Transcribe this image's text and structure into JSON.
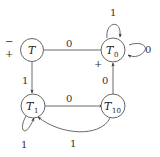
{
  "diagram": {
    "type": "finite-automaton",
    "states": [
      {
        "id": "T",
        "name": "T",
        "subscript": "",
        "start_marker": "−",
        "final_marker": "+"
      },
      {
        "id": "T0",
        "name": "T",
        "subscript": "0",
        "final_marker": "+"
      },
      {
        "id": "T1",
        "name": "T",
        "subscript": "1"
      },
      {
        "id": "T10",
        "name": "T",
        "subscript": "10"
      }
    ],
    "transitions": [
      {
        "from": "T",
        "to": "T0",
        "label": "0"
      },
      {
        "from": "T",
        "to": "T1",
        "label": "1"
      },
      {
        "from": "T0",
        "to": "T0",
        "label": "1",
        "kind": "self-loop-top"
      },
      {
        "from": "T0",
        "to": "T0",
        "label": "0",
        "kind": "self-loop-right"
      },
      {
        "from": "T1",
        "to": "T10",
        "label": "0"
      },
      {
        "from": "T10",
        "to": "T0",
        "label": "0"
      },
      {
        "from": "T10",
        "to": "T1",
        "label": "1",
        "kind": "curve"
      },
      {
        "from": "T1",
        "to": "T1",
        "label": "1",
        "kind": "self-loop-bottom"
      }
    ]
  }
}
